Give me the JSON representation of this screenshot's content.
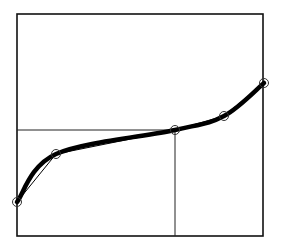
{
  "chart_data": {
    "type": "line",
    "title": "",
    "xlabel": "",
    "ylabel": "",
    "grid": false,
    "frame": {
      "left": 17,
      "top": 14,
      "right": 263,
      "bottom": 236
    },
    "points": [
      {
        "x": 17,
        "y": 202
      },
      {
        "x": 56,
        "y": 154
      },
      {
        "x": 175,
        "y": 130
      },
      {
        "x": 224,
        "y": 116
      },
      {
        "x": 264,
        "y": 83
      }
    ],
    "reference_point": {
      "x": 175,
      "y": 130
    },
    "series": [
      {
        "name": "smooth-curve",
        "style": "thick"
      },
      {
        "name": "polyline",
        "style": "thin"
      }
    ]
  }
}
